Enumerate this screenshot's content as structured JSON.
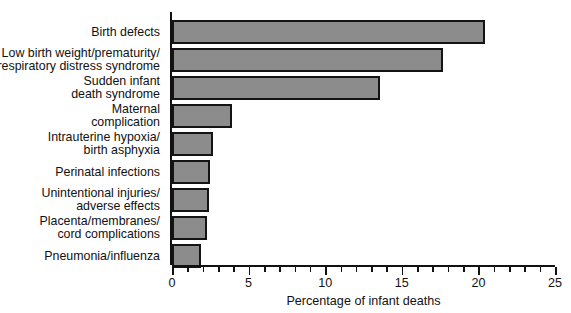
{
  "chart_data": {
    "type": "bar",
    "orientation": "horizontal",
    "title": "",
    "xlabel": "Percentage of infant deaths",
    "ylabel": "",
    "xlim": [
      0,
      25
    ],
    "xticks": [
      0,
      5,
      10,
      15,
      20,
      25
    ],
    "xtick_labels": [
      "0",
      "5",
      "10",
      "15",
      "20",
      "25"
    ],
    "minor_tick_step": 1,
    "grid": false,
    "legend": false,
    "bar_fill_color": "#8c8c8c",
    "bar_edge_color": "#141414",
    "categories": [
      "Birth defects",
      "Low birth weight/prematurity/respiratory distress syndrome",
      "Sudden infant death syndrome",
      "Maternal complication",
      "Intrauterine hypoxia/birth asphyxia",
      "Perinatal infections",
      "Unintentional injuries/adverse effects",
      "Placenta/membranes/cord complications",
      "Pneumonia/influenza"
    ],
    "category_label_lines": [
      [
        "Birth defects"
      ],
      [
        "Low birth weight/prematurity/",
        "respiratory distress syndrome"
      ],
      [
        "Sudden infant",
        "death syndrome"
      ],
      [
        "Maternal",
        "complication"
      ],
      [
        "Intrauterine hypoxia/",
        "birth asphyxia"
      ],
      [
        "Perinatal infections"
      ],
      [
        "Unintentional injuries/",
        "adverse effects"
      ],
      [
        "Placenta/membranes/",
        "cord complications"
      ],
      [
        "Pneumonia/influenza"
      ]
    ],
    "values": [
      20.4,
      17.7,
      13.6,
      3.9,
      2.7,
      2.5,
      2.4,
      2.3,
      1.9
    ]
  }
}
